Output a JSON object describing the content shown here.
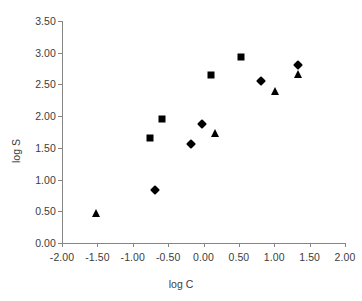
{
  "chart_data": {
    "type": "scatter",
    "title": "",
    "xlabel": "log C",
    "ylabel": "log S",
    "xlim": [
      -2.0,
      2.0
    ],
    "ylim": [
      0.0,
      3.5
    ],
    "xticks": [
      "-2.00",
      "-1.50",
      "-1.00",
      "-0.50",
      "0.00",
      "0.50",
      "1.00",
      "1.50",
      "2.00"
    ],
    "xtick_values": [
      -2.0,
      -1.5,
      -1.0,
      -0.5,
      0.0,
      0.5,
      1.0,
      1.5,
      2.0
    ],
    "yticks": [
      "0.00",
      "0.50",
      "1.00",
      "1.50",
      "2.00",
      "2.50",
      "3.00",
      "3.50"
    ],
    "ytick_values": [
      0.0,
      0.5,
      1.0,
      1.5,
      2.0,
      2.5,
      3.0,
      3.5
    ],
    "grid": false,
    "legend": "none",
    "marker_color": "#000000",
    "axis_color": "#868686",
    "series": [
      {
        "name": "squares",
        "marker": "square",
        "points": [
          {
            "x": -0.76,
            "y": 1.66
          },
          {
            "x": -0.59,
            "y": 1.95
          },
          {
            "x": 0.11,
            "y": 2.65
          },
          {
            "x": 0.53,
            "y": 2.93
          }
        ]
      },
      {
        "name": "diamonds",
        "marker": "diamond",
        "points": [
          {
            "x": -0.69,
            "y": 0.83
          },
          {
            "x": -0.18,
            "y": 1.56
          },
          {
            "x": -0.02,
            "y": 1.87
          },
          {
            "x": 0.81,
            "y": 2.55
          },
          {
            "x": 1.33,
            "y": 2.8
          }
        ]
      },
      {
        "name": "triangles",
        "marker": "triangle",
        "points": [
          {
            "x": -1.52,
            "y": 0.48
          },
          {
            "x": 0.16,
            "y": 1.74
          },
          {
            "x": 1.01,
            "y": 2.4
          },
          {
            "x": 1.33,
            "y": 2.66
          }
        ]
      }
    ]
  }
}
